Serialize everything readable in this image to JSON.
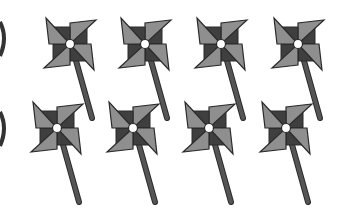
{
  "scene": {
    "description": "Clip-art of eight grayscale pinwheels arranged in two rows of four, with partial arcs at the left edge",
    "background": "#ffffff",
    "colors": {
      "dark": "#3f3f3f",
      "light": "#8f8f8f",
      "stem": "#555555",
      "outline": "#2a2a2a",
      "hub": "#ffffff"
    },
    "pinwheels": [
      {
        "row": 1,
        "cx": 70,
        "cy": 44
      },
      {
        "row": 1,
        "cx": 145,
        "cy": 44
      },
      {
        "row": 1,
        "cx": 221,
        "cy": 44
      },
      {
        "row": 1,
        "cx": 298,
        "cy": 44
      },
      {
        "row": 2,
        "cx": 57,
        "cy": 128
      },
      {
        "row": 2,
        "cx": 133,
        "cy": 128
      },
      {
        "row": 2,
        "cx": 209,
        "cy": 128
      },
      {
        "row": 2,
        "cx": 286,
        "cy": 128
      }
    ],
    "pinwheel_count": 8
  }
}
